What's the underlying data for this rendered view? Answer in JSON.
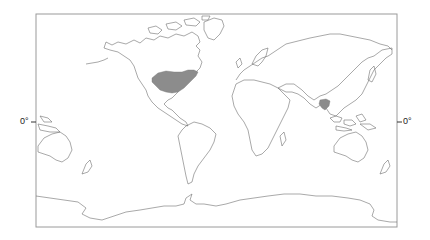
{
  "map": {
    "projection": "equirectangular world map, Pacific-centered",
    "frame": {
      "left": 36,
      "top": 14,
      "right": 397,
      "bottom": 227
    },
    "equator_label_left": "0°",
    "equator_label_right": "0°",
    "shade_color": "#8c8c8c",
    "coast_color": "#6e6e6e",
    "shaded_regions": [
      {
        "name": "Eastern United States"
      },
      {
        "name": "Southern China / northern Indochina"
      }
    ]
  }
}
